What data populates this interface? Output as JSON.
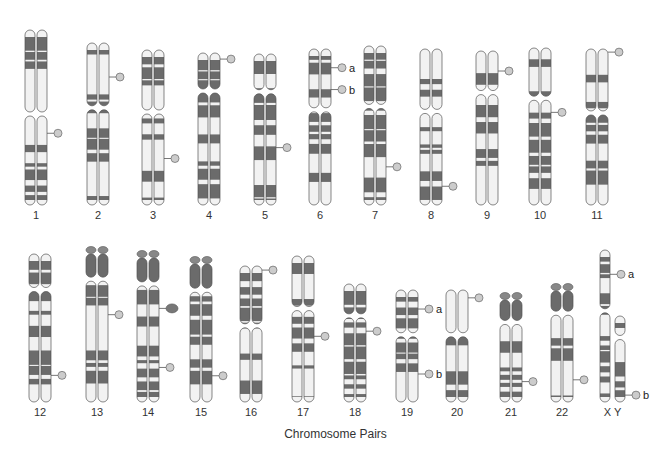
{
  "diagram": {
    "title": "Chromosome Pairs",
    "colors": {
      "dark_band": "#6b6b6b",
      "light_band": "#f2f2f2",
      "outline": "#555555",
      "marker": "#cccccc"
    },
    "chromosomes": [
      {
        "id": "1",
        "label": "1",
        "row": 1,
        "x": 36,
        "top": 30,
        "bottom": 205,
        "cen": 0.48,
        "markers": [
          {
            "side": "right",
            "pos": 0.59,
            "letter": ""
          }
        ]
      },
      {
        "id": "2",
        "label": "2",
        "row": 1,
        "x": 98,
        "top": 43,
        "bottom": 205,
        "cen": 0.4,
        "markers": [
          {
            "side": "right",
            "pos": 0.21,
            "letter": ""
          }
        ]
      },
      {
        "id": "3",
        "label": "3",
        "row": 1,
        "x": 153,
        "top": 50,
        "bottom": 205,
        "cen": 0.4,
        "markers": [
          {
            "side": "right",
            "pos": 0.7,
            "letter": ""
          }
        ]
      },
      {
        "id": "4",
        "label": "4",
        "row": 1,
        "x": 209,
        "top": 53,
        "bottom": 205,
        "cen": 0.25,
        "markers": [
          {
            "side": "right",
            "pos": 0.04,
            "letter": ""
          }
        ]
      },
      {
        "id": "5",
        "label": "5",
        "row": 1,
        "x": 265,
        "top": 54,
        "bottom": 205,
        "cen": 0.25,
        "markers": [
          {
            "side": "right",
            "pos": 0.62,
            "letter": ""
          }
        ]
      },
      {
        "id": "6",
        "label": "6",
        "row": 1,
        "x": 320,
        "top": 49,
        "bottom": 205,
        "cen": 0.39,
        "markers": [
          {
            "side": "right",
            "pos": 0.12,
            "letter": "a"
          },
          {
            "side": "right",
            "pos": 0.26,
            "letter": "b"
          }
        ]
      },
      {
        "id": "7",
        "label": "7",
        "row": 1,
        "x": 375,
        "top": 46,
        "bottom": 205,
        "cen": 0.38,
        "markers": [
          {
            "side": "right",
            "pos": 0.76,
            "letter": ""
          }
        ]
      },
      {
        "id": "8",
        "label": "8",
        "row": 1,
        "x": 431,
        "top": 49,
        "bottom": 205,
        "cen": 0.4,
        "markers": [
          {
            "side": "right",
            "pos": 0.88,
            "letter": ""
          }
        ]
      },
      {
        "id": "9",
        "label": "9",
        "row": 1,
        "x": 487,
        "top": 51,
        "bottom": 205,
        "cen": 0.27,
        "markers": [
          {
            "side": "right",
            "pos": 0.13,
            "letter": ""
          }
        ]
      },
      {
        "id": "10",
        "label": "10",
        "row": 1,
        "x": 540,
        "top": 48,
        "bottom": 205,
        "cen": 0.32,
        "markers": [
          {
            "side": "right",
            "pos": 0.41,
            "letter": ""
          }
        ]
      },
      {
        "id": "11",
        "label": "11",
        "row": 1,
        "x": 597,
        "top": 49,
        "bottom": 205,
        "cen": 0.41,
        "markers": [
          {
            "side": "right",
            "pos": 0.02,
            "letter": ""
          }
        ]
      },
      {
        "id": "12",
        "label": "12",
        "row": 2,
        "x": 40,
        "top": 254,
        "bottom": 402,
        "cen": 0.24,
        "markers": [
          {
            "side": "right",
            "pos": 0.82,
            "letter": ""
          }
        ]
      },
      {
        "id": "13",
        "label": "13",
        "row": 2,
        "x": 97,
        "top": 254,
        "bottom": 402,
        "cen": 0.17,
        "acro": true,
        "markers": [
          {
            "side": "right",
            "pos": 0.41,
            "letter": ""
          }
        ]
      },
      {
        "id": "14",
        "label": "14",
        "row": 2,
        "x": 148,
        "top": 258,
        "bottom": 402,
        "cen": 0.18,
        "acro": true,
        "markers": [
          {
            "side": "right",
            "pos": 0.35,
            "letter": "",
            "big": true
          },
          {
            "side": "right",
            "pos": 0.76,
            "letter": ""
          }
        ]
      },
      {
        "id": "15",
        "label": "15",
        "row": 2,
        "x": 201,
        "top": 264,
        "bottom": 402,
        "cen": 0.19,
        "acro": true,
        "markers": [
          {
            "side": "right",
            "pos": 0.81,
            "letter": ""
          }
        ]
      },
      {
        "id": "16",
        "label": "16",
        "row": 2,
        "x": 251,
        "top": 266,
        "bottom": 402,
        "cen": 0.44,
        "markers": [
          {
            "side": "right",
            "pos": 0.03,
            "letter": ""
          }
        ]
      },
      {
        "id": "17",
        "label": "17",
        "row": 2,
        "x": 303,
        "top": 256,
        "bottom": 402,
        "cen": 0.36,
        "markers": [
          {
            "side": "right",
            "pos": 0.55,
            "letter": ""
          }
        ]
      },
      {
        "id": "18",
        "label": "18",
        "row": 2,
        "x": 355,
        "top": 284,
        "bottom": 402,
        "cen": 0.27,
        "markers": [
          {
            "side": "right",
            "pos": 0.4,
            "letter": ""
          }
        ]
      },
      {
        "id": "19",
        "label": "19",
        "row": 2,
        "x": 407,
        "top": 290,
        "bottom": 402,
        "cen": 0.4,
        "markers": [
          {
            "side": "right",
            "pos": 0.17,
            "letter": "a"
          },
          {
            "side": "right",
            "pos": 0.75,
            "letter": "b"
          }
        ]
      },
      {
        "id": "20",
        "label": "20",
        "row": 2,
        "x": 457,
        "top": 290,
        "bottom": 402,
        "cen": 0.4,
        "markers": [
          {
            "side": "right",
            "pos": 0.07,
            "letter": ""
          }
        ]
      },
      {
        "id": "21",
        "label": "21",
        "row": 2,
        "x": 511,
        "top": 300,
        "bottom": 402,
        "cen": 0.22,
        "acro": true,
        "markers": [
          {
            "side": "right",
            "pos": 0.8,
            "letter": ""
          }
        ]
      },
      {
        "id": "22",
        "label": "22",
        "row": 2,
        "x": 562,
        "top": 291,
        "bottom": 402,
        "cen": 0.2,
        "acro": true,
        "markers": [
          {
            "side": "right",
            "pos": 0.8,
            "letter": ""
          }
        ]
      }
    ],
    "sex_chromosomes": {
      "label": "X Y",
      "x": {
        "x": 605,
        "top": 250,
        "bottom": 402,
        "cen": 0.4,
        "markers": [
          {
            "pos": 0.16,
            "letter": "a"
          }
        ]
      },
      "y": {
        "x": 620,
        "top": 316,
        "bottom": 402,
        "cen": 0.25,
        "markers": [
          {
            "pos": 0.92,
            "letter": "b"
          }
        ]
      }
    }
  }
}
